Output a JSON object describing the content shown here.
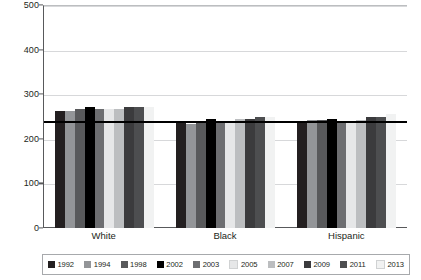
{
  "chart_data": {
    "type": "bar",
    "title": "",
    "xlabel": "",
    "ylabel": "Scale score (basic 243–280)",
    "ylim": [
      0,
      500
    ],
    "yticks": [
      0,
      100,
      200,
      300,
      400,
      500
    ],
    "grid": true,
    "legend_position": "bottom",
    "categories": [
      "White",
      "Black",
      "Hispanic"
    ],
    "reference_line": {
      "value": 243,
      "label": "basic 243",
      "color": "#000000"
    },
    "series": [
      {
        "name": "1992",
        "color": "#231f20",
        "values": [
          263,
          237,
          237
        ]
      },
      {
        "name": "1994",
        "color": "#939598",
        "values": [
          264,
          234,
          243
        ]
      },
      {
        "name": "1998",
        "color": "#58595b",
        "values": [
          269,
          240,
          243
        ]
      },
      {
        "name": "2002",
        "color": "#000000",
        "values": [
          272,
          245,
          245
        ]
      },
      {
        "name": "2003",
        "color": "#6d6e71",
        "values": [
          269,
          241,
          242
        ]
      },
      {
        "name": "2005",
        "color": "#e6e7e8",
        "values": [
          269,
          241,
          242
        ]
      },
      {
        "name": "2007",
        "color": "#bcbec0",
        "values": [
          269,
          245,
          243
        ]
      },
      {
        "name": "2009",
        "color": "#3b3b3d",
        "values": [
          272,
          246,
          249
        ]
      },
      {
        "name": "2011",
        "color": "#4d4e50",
        "values": [
          272,
          249,
          251
        ]
      },
      {
        "name": "2013",
        "color": "#f1f2f2",
        "values": [
          272,
          250,
          256
        ]
      }
    ]
  },
  "legend": {
    "items": [
      {
        "label": "1992",
        "color": "#231f20"
      },
      {
        "label": "1994",
        "color": "#939598"
      },
      {
        "label": "1998",
        "color": "#58595b"
      },
      {
        "label": "2002",
        "color": "#000000"
      },
      {
        "label": "2003",
        "color": "#6d6e71"
      },
      {
        "label": "2005",
        "color": "#e6e7e8"
      },
      {
        "label": "2007",
        "color": "#bcbec0"
      },
      {
        "label": "2009",
        "color": "#3b3b3d"
      },
      {
        "label": "2011",
        "color": "#4d4e50"
      },
      {
        "label": "2013",
        "color": "#f1f2f2"
      }
    ]
  }
}
